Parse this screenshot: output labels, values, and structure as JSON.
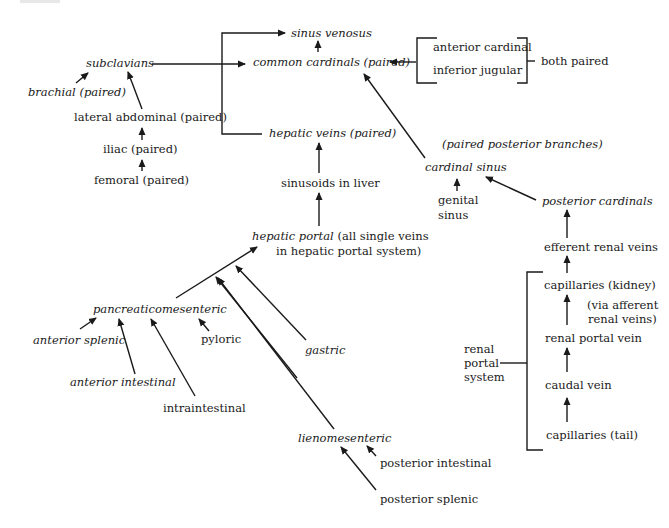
{
  "diagram": {
    "title": "",
    "nodes": {
      "sinus_venosus": "sinus venosus",
      "common_cardinals": "common cardinals (paired)",
      "anterior_cardinal": "anterior cardinal",
      "inferior_jugular": "inferior jugular",
      "both_paired": "both paired",
      "subclavians": "subclavians",
      "brachial": "brachial (paired)",
      "lateral_abdominal": "lateral abdominal (paired)",
      "iliac": "iliac (paired)",
      "femoral": "femoral (paired)",
      "hepatic_veins": "hepatic veins (paired)",
      "sinusoids": "sinusoids in liver",
      "hepatic_portal_italic": "hepatic portal",
      "hepatic_portal_note1": " (all single veins",
      "hepatic_portal_note2": "in hepatic portal system)",
      "paired_posterior_branches": "(paired posterior branches)",
      "cardinal_sinus": "cardinal sinus",
      "genital_sinus_1": "genital",
      "genital_sinus_2": "sinus",
      "posterior_cardinals": "posterior cardinals",
      "efferent_renal_veins": "efferent renal veins",
      "capillaries_kidney": "capillaries (kidney)",
      "via_afferent_1": "(via afferent",
      "via_afferent_2": "renal veins)",
      "renal_portal_vein": "renal portal vein",
      "caudal_vein": "caudal vein",
      "capillaries_tail": "capillaries (tail)",
      "renal_portal_system_1": "renal",
      "renal_portal_system_2": "portal",
      "renal_portal_system_3": "system",
      "pancreaticomesenteric": "pancreaticomesenteric",
      "anterior_splenic": "anterior splenic",
      "anterior_intestinal": "anterior intestinal",
      "intraintestinal": "intraintestinal",
      "pyloric": "pyloric",
      "gastric": "gastric",
      "lienomesenteric": "lienomesenteric",
      "posterior_intestinal": "posterior intestinal",
      "posterior_splenic": "posterior splenic"
    },
    "edges": [
      [
        "common cardinals (paired)",
        "sinus venosus"
      ],
      [
        "hepatic veins (paired)",
        "sinus venosus"
      ],
      [
        "anterior cardinal",
        "common cardinals (paired)"
      ],
      [
        "inferior jugular",
        "common cardinals (paired)"
      ],
      [
        "subclavians",
        "common cardinals (paired)"
      ],
      [
        "cardinal sinus",
        "common cardinals (paired)"
      ],
      [
        "brachial (paired)",
        "subclavians"
      ],
      [
        "lateral abdominal (paired)",
        "subclavians"
      ],
      [
        "iliac (paired)",
        "lateral abdominal (paired)"
      ],
      [
        "femoral (paired)",
        "iliac (paired)"
      ],
      [
        "sinusoids in liver",
        "hepatic veins (paired)"
      ],
      [
        "hepatic portal",
        "sinusoids in liver"
      ],
      [
        "pancreaticomesenteric",
        "hepatic portal"
      ],
      [
        "lienomesenteric",
        "hepatic portal"
      ],
      [
        "intraintestinal",
        "hepatic portal"
      ],
      [
        "gastric",
        "hepatic portal"
      ],
      [
        "anterior splenic",
        "pancreaticomesenteric"
      ],
      [
        "anterior intestinal",
        "pancreaticomesenteric"
      ],
      [
        "pyloric",
        "pancreaticomesenteric"
      ],
      [
        "posterior intestinal",
        "lienomesenteric"
      ],
      [
        "posterior splenic",
        "lienomesenteric"
      ],
      [
        "genital sinus",
        "cardinal sinus"
      ],
      [
        "posterior cardinals",
        "cardinal sinus"
      ],
      [
        "efferent renal veins",
        "posterior cardinals"
      ],
      [
        "capillaries (kidney)",
        "efferent renal veins"
      ],
      [
        "renal portal vein",
        "capillaries (kidney)"
      ],
      [
        "caudal vein",
        "renal portal vein"
      ],
      [
        "capillaries (tail)",
        "caudal vein"
      ]
    ],
    "colors": {
      "ink": "#1a1a1a",
      "background": "#ffffff"
    }
  }
}
